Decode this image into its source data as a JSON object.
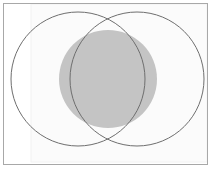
{
  "figure": {
    "canvas": {
      "width": 214,
      "height": 171
    },
    "background_color": "#ffffff",
    "frame": {
      "outer_margin_color": "#ffffff",
      "border_color": "#a8a8a8",
      "border_width": 1,
      "x": 3,
      "y": 3,
      "width": 205,
      "height": 162,
      "fill": "#fdfdfd"
    },
    "inner_panel": {
      "edge_color": "#f2f2f2",
      "fill": "#fbfbfb",
      "x": 31,
      "y": 4,
      "width": 176,
      "height": 158
    },
    "shaded_disc": {
      "label": "central shaded circle",
      "cx": 108,
      "cy": 79,
      "r": 49,
      "fill": "#c4c4c4",
      "stroke": "none"
    },
    "outline_circles": [
      {
        "label": "left circle",
        "cx": 78,
        "cy": 79,
        "r": 67,
        "fill": "none",
        "stroke": "#6e6e6e",
        "stroke_width": 1
      },
      {
        "label": "right circle",
        "cx": 137,
        "cy": 79,
        "r": 67,
        "fill": "none",
        "stroke": "#6e6e6e",
        "stroke_width": 1
      }
    ],
    "intersection_points": [
      {
        "label": "upper crossing",
        "x": 108,
        "y": 27
      },
      {
        "label": "lower crossing",
        "x": 108,
        "y": 131
      }
    ]
  }
}
